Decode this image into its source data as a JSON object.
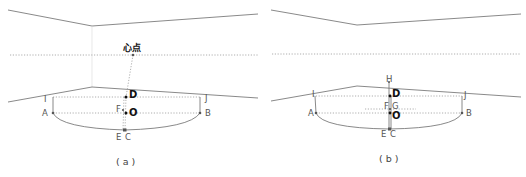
{
  "panels": [
    {
      "id": "a",
      "caption": "( a )",
      "labels": {
        "heart_point": "心点",
        "A": "A",
        "B": "B",
        "C": "C",
        "D": "D",
        "E": "E",
        "F": "F",
        "I": "I",
        "J": "J",
        "O": "O"
      }
    },
    {
      "id": "b",
      "caption": "( b )",
      "labels": {
        "A": "A",
        "B": "B",
        "C": "C",
        "D": "D",
        "E": "E",
        "F": "F",
        "G": "G",
        "H": "H",
        "I": "I",
        "J": "J",
        "O": "O"
      }
    }
  ],
  "colors": {
    "line": "#6b6b6b",
    "dotted": "#9a9a9a",
    "label": "#555555",
    "bold_label": "#111111"
  }
}
